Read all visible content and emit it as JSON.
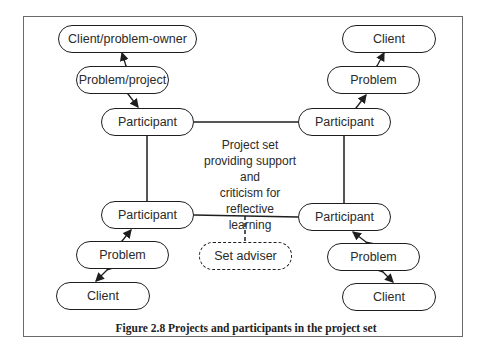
{
  "figure": {
    "caption": "Figure 2.8  Projects and participants in the project set",
    "center_label": [
      "Project set",
      "providing support and",
      "criticism for reflective",
      "learning"
    ]
  },
  "nodes": {
    "tl_client": "Client/problem-owner",
    "tl_problem": "Problem/project",
    "tl_participant": "Participant",
    "tr_client": "Client",
    "tr_problem": "Problem",
    "tr_participant": "Participant",
    "bl_participant": "Participant",
    "bl_problem": "Problem",
    "bl_client": "Client",
    "br_participant": "Participant",
    "br_problem": "Problem",
    "br_client": "Client",
    "set_adviser": "Set adviser"
  }
}
